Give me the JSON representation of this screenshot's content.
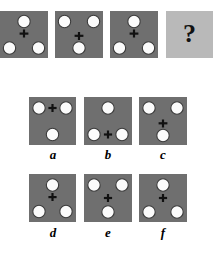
{
  "puzzle": {
    "type": "visual-analogy-matrix",
    "prompt_glyph": "?",
    "colors": {
      "tile_fill": "#6f6f6f",
      "question_tile_fill": "#b9b9b9",
      "dot_fill": "#fbfbfb",
      "dot_stroke": "#3a3a3a",
      "mark_stroke": "#111111",
      "page_background": "#ffffff",
      "label_color": "#000000"
    },
    "sequence": {
      "name": "sequence-row",
      "tiles": [
        {
          "id": "sequence-tile-1",
          "kind": "dark",
          "dots": [
            "top-center",
            "bottom-left",
            "bottom-right"
          ],
          "symbol": "venus-down",
          "symbol_position": "top-center-below-dot",
          "symbol_description": "circle with cross below it"
        },
        {
          "id": "sequence-tile-2",
          "kind": "dark",
          "dots": [
            "top-left",
            "top-right",
            "bottom-center"
          ],
          "symbol": "venus-up",
          "symbol_position": "bottom-center-above-dot",
          "symbol_description": "cross above circle (rotated 180 degrees)"
        },
        {
          "id": "sequence-tile-3",
          "kind": "dark",
          "dots": [
            "top-center",
            "bottom-left",
            "bottom-right"
          ],
          "symbol": "venus-down",
          "symbol_position": "top-center-below-dot",
          "symbol_description": "circle with cross below it"
        },
        {
          "id": "sequence-tile-question",
          "kind": "light",
          "dots": [],
          "symbol": "question-mark",
          "symbol_position": "center",
          "symbol_description": "unknown answer placeholder"
        }
      ]
    },
    "options": {
      "name": "answer-options",
      "items": [
        {
          "id": "option-a",
          "label": "a",
          "dots": [
            "top-left",
            "top-right",
            "bottom-center"
          ],
          "symbol": "plus",
          "symbol_position": "top-center-between-dots",
          "symbol_description": "standalone cross between the two top circles"
        },
        {
          "id": "option-b",
          "label": "b",
          "dots": [
            "top-center",
            "bottom-left",
            "bottom-right"
          ],
          "symbol": "plus",
          "symbol_position": "bottom-center-between-dots",
          "symbol_description": "standalone cross between the two bottom circles"
        },
        {
          "id": "option-c",
          "label": "c",
          "dots": [
            "top-left",
            "top-right",
            "bottom-center"
          ],
          "symbol": "venus-up",
          "symbol_position": "bottom-center-above-dot",
          "symbol_description": "cross above the bottom circle"
        },
        {
          "id": "option-d",
          "label": "d",
          "dots": [
            "top-center",
            "bottom-left",
            "bottom-right"
          ],
          "symbol": "venus-down",
          "symbol_position": "top-center-below-dot",
          "symbol_description": "circle with cross below it"
        },
        {
          "id": "option-e",
          "label": "e",
          "dots": [
            "top-left",
            "top-right",
            "bottom-center"
          ],
          "symbol": "plus",
          "symbol_position": "center",
          "symbol_description": "detached cross in the middle of the tile"
        },
        {
          "id": "option-f",
          "label": "f",
          "dots": [
            "top-center",
            "bottom-left",
            "bottom-right"
          ],
          "symbol": "plus",
          "symbol_position": "center",
          "symbol_description": "detached cross in the middle of the tile"
        }
      ]
    }
  }
}
